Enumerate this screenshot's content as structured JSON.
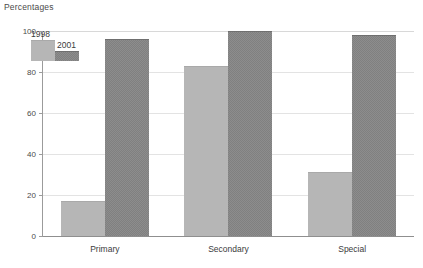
{
  "chart_data": {
    "type": "bar",
    "title": "Percentages",
    "xlabel": "",
    "ylabel": "",
    "ylim": [
      0,
      100
    ],
    "yticks": [
      0,
      20,
      40,
      60,
      80,
      100
    ],
    "ytick_labels": [
      "0",
      "20",
      "40",
      "60",
      "80",
      "100"
    ],
    "grid": true,
    "legend_position": "top-left-inside",
    "categories": [
      "Primary",
      "Secondary",
      "Special"
    ],
    "series": [
      {
        "name": "1998",
        "color": "#b6b6b6",
        "values": [
          17,
          83,
          31
        ]
      },
      {
        "name": "2001",
        "color": "#808080",
        "values": [
          96,
          100,
          98
        ]
      }
    ]
  },
  "legend": {
    "items": [
      {
        "label": "1998"
      },
      {
        "label": "2001"
      }
    ]
  }
}
